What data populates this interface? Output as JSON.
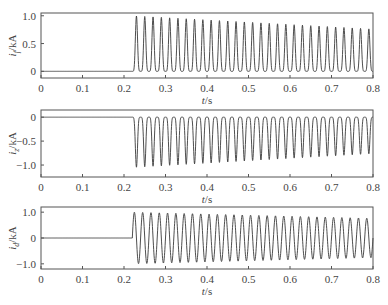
{
  "chart_data": [
    {
      "type": "line",
      "ylabel": "i_f/kA",
      "ylabel_main": "i",
      "ylabel_sub": "f",
      "ylabel_unit": "/kA",
      "xlabel": "t/s",
      "xlim": [
        0,
        0.8
      ],
      "ylim": [
        -0.12,
        1.05
      ],
      "xticks": [
        0,
        0.1,
        0.2,
        0.3,
        0.4,
        0.5,
        0.6,
        0.7,
        0.8
      ],
      "xtick_labels": [
        "0",
        "0.1",
        "0.2",
        "0.3",
        "0.4",
        "0.5",
        "0.6",
        "0.7",
        "0.8"
      ],
      "yticks": [
        0,
        0.5,
        1.0
      ],
      "ytick_labels": [
        "0",
        "0.5",
        "1.0"
      ],
      "grid": false,
      "series": [
        {
          "name": "i_f",
          "description": "Zero until fault at t≈0.22 s, then unidirectional 50 Hz pulse train with peaks decaying from ≈1.0 to ≈0.75 kA",
          "fault_time": 0.22,
          "frequency_hz": 50,
          "baseline": 0,
          "waveform": "positive-pulse",
          "peak_start": 1.0,
          "peak_end": 0.76
        }
      ]
    },
    {
      "type": "line",
      "ylabel": "i_z/kA",
      "ylabel_main": "i",
      "ylabel_sub": "z",
      "ylabel_unit": "/kA",
      "xlabel": "t/s",
      "xlim": [
        0,
        0.8
      ],
      "ylim": [
        -1.25,
        0.15
      ],
      "xticks": [
        0,
        0.1,
        0.2,
        0.3,
        0.4,
        0.5,
        0.6,
        0.7,
        0.8
      ],
      "xtick_labels": [
        "0",
        "0.1",
        "0.2",
        "0.3",
        "0.4",
        "0.5",
        "0.6",
        "0.7",
        "0.8"
      ],
      "yticks": [
        0,
        -0.5,
        -1.0
      ],
      "ytick_labels": [
        "0",
        "−0.5",
        "−1.0"
      ],
      "grid": false,
      "series": [
        {
          "name": "i_z",
          "description": "Zero until fault at t≈0.22 s, then unidirectional negative 50 Hz pulse train with troughs decaying from ≈−1.05 to ≈−0.75 kA",
          "fault_time": 0.22,
          "frequency_hz": 50,
          "baseline": 0,
          "waveform": "negative-pulse",
          "peak_start": -1.05,
          "peak_end": -0.76
        }
      ]
    },
    {
      "type": "line",
      "ylabel": "i_d/kA",
      "ylabel_main": "i",
      "ylabel_sub": "d",
      "ylabel_unit": "/kA",
      "xlabel": "t/s",
      "xlim": [
        0,
        0.8
      ],
      "ylim": [
        -1.2,
        1.2
      ],
      "xticks": [
        0,
        0.1,
        0.2,
        0.3,
        0.4,
        0.5,
        0.6,
        0.7,
        0.8
      ],
      "xtick_labels": [
        "0",
        "0.1",
        "0.2",
        "0.3",
        "0.4",
        "0.5",
        "0.6",
        "0.7",
        "0.8"
      ],
      "yticks": [
        1.0,
        0,
        -1.0
      ],
      "ytick_labels": [
        "1.0",
        "0",
        "−1.0"
      ],
      "grid": false,
      "series": [
        {
          "name": "i_d",
          "description": "Zero until fault at t≈0.22 s, then bipolar 50 Hz oscillation with amplitude decaying from ≈1.0 to ≈0.75 kA",
          "fault_time": 0.22,
          "frequency_hz": 50,
          "baseline": 0,
          "waveform": "bipolar",
          "peak_start": 1.0,
          "peak_end": 0.76
        }
      ]
    }
  ],
  "panels": [
    {
      "x0": 41,
      "x1": 373,
      "y0": 13,
      "y1": 78,
      "tick_y": 83
    },
    {
      "x0": 41,
      "x1": 373,
      "y0": 110,
      "y1": 177,
      "tick_y": 182
    },
    {
      "x0": 41,
      "x1": 373,
      "y0": 207,
      "y1": 269,
      "tick_y": 274
    }
  ],
  "style": {
    "line_color": "#3a3a3a",
    "frame_color": "#555555"
  }
}
